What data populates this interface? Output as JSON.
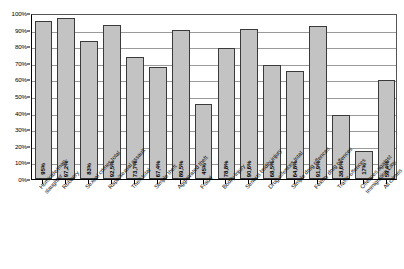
{
  "chart_data": {
    "type": "bar",
    "title": "",
    "subtitle": "",
    "xlabel": "",
    "ylabel": "",
    "ylim": [
      0,
      100
    ],
    "y_unit": "%",
    "grid": true,
    "legend": false,
    "legend_position": "none",
    "orientation": "vertical",
    "bar_color": "#c3c3c3",
    "bar_border_color": "#3a3a3a",
    "y_ticks": [
      "0%",
      "10%",
      "20%",
      "30%",
      "40%",
      "50%",
      "60%",
      "70%",
      "80%",
      "90%",
      "100%"
    ],
    "y_tick_values": [
      0,
      10,
      20,
      30,
      40,
      50,
      60,
      70,
      80,
      90,
      100
    ],
    "categories": [
      "Homicide/man-slaughter",
      "Robbery",
      "Sexual crimes total",
      "Rape/sexual assault",
      "Theft total",
      "Simple theft",
      "Aggravated theft",
      "Fraud",
      "Bodily injury",
      "Serious bodily injury",
      "Drug offences total",
      "Simple drug offences",
      "Felony drug offences",
      "Traffic offences",
      "Offences against Immigration Law",
      "All crimes"
    ],
    "category_lines": [
      [
        "Homicide/man-",
        "slaughter"
      ],
      [
        "Robbery"
      ],
      [
        "Sexual crimes total"
      ],
      [
        "Rape/sexual assault"
      ],
      [
        "Theft total"
      ],
      [
        "Simple theft"
      ],
      [
        "Aggravated theft"
      ],
      [
        "Fraud"
      ],
      [
        "Bodily injury"
      ],
      [
        "Serious bodily injury"
      ],
      [
        "Drug offences total"
      ],
      [
        "Simple drug offences"
      ],
      [
        "Felony drug offences"
      ],
      [
        "Traffic offences"
      ],
      [
        "Offences against",
        "Immigration Law"
      ],
      [
        "All crimes"
      ]
    ],
    "values": [
      95,
      97.2,
      83,
      92.5,
      73.7,
      67.4,
      89.5,
      45,
      78.8,
      90.6,
      68.5,
      64.8,
      91.9,
      38.6,
      17,
      59.4
    ],
    "value_labels": [
      "95%",
      "97,2%",
      "83%",
      "92,5%",
      "73,7%",
      "67,4%",
      "89,5%",
      "45%",
      "78,8%",
      "90,6%",
      "68,5%",
      "64,8%",
      "91,9%",
      "38,6%",
      "17%",
      "59,4%"
    ]
  }
}
